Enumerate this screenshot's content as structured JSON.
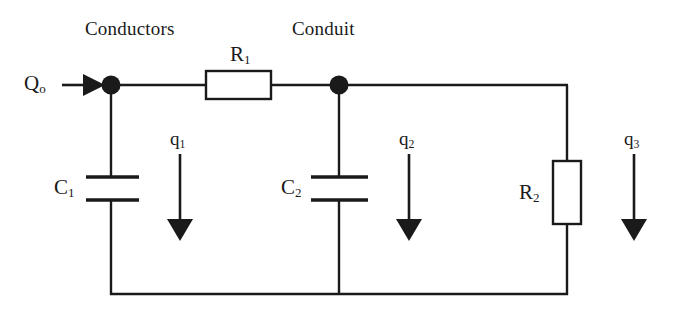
{
  "figure": {
    "type": "electrical-circuit-diagram",
    "background_color": "#ffffff",
    "line_color": "#1a1a1a",
    "width": 680,
    "height": 311
  },
  "annotations": {
    "conductors_label": "Conductors",
    "conduit_label": "Conduit"
  },
  "components": {
    "source": {
      "label_html": "Q<sub>o</sub>",
      "kind": "input-flow-arrow"
    },
    "resistor_1": {
      "label_html": "R<sub>1</sub>",
      "kind": "resistor",
      "orientation": "horizontal"
    },
    "resistor_2": {
      "label_html": "R<sub>2</sub>",
      "kind": "resistor",
      "orientation": "vertical"
    },
    "capacitor_1": {
      "label_html": "C<sub>1</sub>",
      "kind": "capacitor",
      "orientation": "vertical"
    },
    "capacitor_2": {
      "label_html": "C<sub>2</sub>",
      "kind": "capacitor",
      "orientation": "vertical"
    }
  },
  "branch_flows": [
    {
      "label_html": "q<sub>1</sub>",
      "direction": "down"
    },
    {
      "label_html": "q<sub>2</sub>",
      "direction": "down"
    },
    {
      "label_html": "q<sub>3</sub>",
      "direction": "down"
    }
  ],
  "nodes": [
    {
      "name": "node-left",
      "x": 111,
      "y": 85
    },
    {
      "name": "node-right",
      "x": 339,
      "y": 85
    }
  ]
}
